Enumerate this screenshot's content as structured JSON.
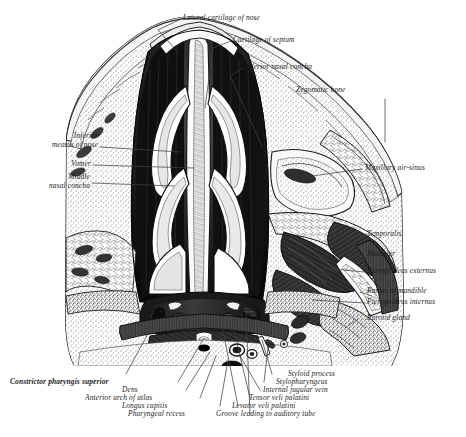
{
  "figure": {
    "background_color": "#ffffff",
    "ink_color": "#1b1b1b",
    "leader_color": "#4a4a4a"
  },
  "labels": {
    "top": [
      {
        "text": "Lateral cartilage of nose"
      },
      {
        "text": "Cartilage of septum"
      },
      {
        "text": "Inferior nasal concha"
      },
      {
        "text": "Zygomatic bone"
      }
    ],
    "left": [
      {
        "line1": "Inferior",
        "line2": "meatus of nose"
      },
      {
        "line1": "Vomer",
        "line2": ""
      },
      {
        "line1": "Middle",
        "line2": "nasal concha"
      }
    ],
    "right": [
      {
        "text": "Maxillary air-sinus"
      },
      {
        "text": "Temporalis"
      },
      {
        "text": "Masseter"
      },
      {
        "text": "Pterygoideus externus"
      },
      {
        "text": "Ramus of mandible"
      },
      {
        "text": "Pterygoideus internus"
      },
      {
        "text": "Parotid gland"
      }
    ],
    "bottom_left": [
      {
        "text": "Constrictor pharyngis superior"
      },
      {
        "text": "Dens"
      },
      {
        "text": "Anterior arch of atlas"
      },
      {
        "text": "Longus capitis"
      },
      {
        "text": "Pharyngeal recess"
      }
    ],
    "bottom_right": [
      {
        "text": "Styloid process"
      },
      {
        "text": "Stylopharyngeus"
      },
      {
        "text": "Internal jugular vein"
      },
      {
        "text": "Tensor veli palatini"
      },
      {
        "text": "Levator veli palatini"
      },
      {
        "text": "Groove leading to auditory tube"
      }
    ]
  }
}
